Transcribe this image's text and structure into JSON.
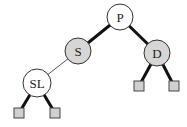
{
  "diagram": {
    "type": "binary-tree",
    "colors": {
      "node_white": "#ffffff",
      "node_gray": "#d6d6d6",
      "leaf_fill": "#d0d0d0",
      "stroke": "#333333",
      "edge": "#111111"
    },
    "nodes": [
      {
        "id": "P",
        "label": "P",
        "fill": "white"
      },
      {
        "id": "S",
        "label": "S",
        "fill": "gray"
      },
      {
        "id": "D",
        "label": "D",
        "fill": "gray"
      },
      {
        "id": "SL",
        "label": "SL",
        "fill": "white"
      }
    ],
    "leaves": [
      {
        "id": "leaf-sl-left",
        "parent": "SL"
      },
      {
        "id": "leaf-sl-right",
        "parent": "SL"
      },
      {
        "id": "leaf-d-left",
        "parent": "D"
      },
      {
        "id": "leaf-d-right",
        "parent": "D"
      }
    ],
    "edges": [
      {
        "from": "P",
        "to": "S",
        "style": "thick"
      },
      {
        "from": "P",
        "to": "D",
        "style": "thick"
      },
      {
        "from": "S",
        "to": "SL",
        "style": "thin"
      },
      {
        "from": "SL",
        "to": "leaf-sl-left",
        "style": "thick"
      },
      {
        "from": "SL",
        "to": "leaf-sl-right",
        "style": "thick"
      },
      {
        "from": "D",
        "to": "leaf-d-left",
        "style": "thick"
      },
      {
        "from": "D",
        "to": "leaf-d-right",
        "style": "thick"
      }
    ]
  }
}
